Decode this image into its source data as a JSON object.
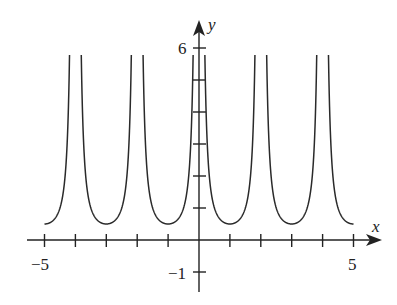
{
  "chart_data": {
    "type": "line",
    "title": "",
    "xlabel": "x",
    "ylabel": "y",
    "function": "y = 1/(2 sin^2(pi x / 2)) = 1/(1 - cos(pi x))",
    "xlim": [
      -5,
      5
    ],
    "ylim": [
      -1,
      6
    ],
    "grid": false,
    "legend": null,
    "x_tick_values": [
      -5,
      -4,
      -3,
      -2,
      -1,
      1,
      2,
      3,
      4,
      5
    ],
    "x_tick_labels": [
      {
        "value": -5,
        "label": "−5"
      },
      {
        "value": 5,
        "label": "5"
      }
    ],
    "y_tick_values": [
      -1,
      1,
      2,
      3,
      4,
      5,
      6
    ],
    "y_tick_labels": [
      {
        "value": 6,
        "label": "6"
      },
      {
        "value": -1,
        "label": "−1"
      }
    ],
    "vertical_asymptotes": [
      -4,
      -2,
      0,
      2,
      4
    ],
    "period": 2,
    "local_minima": [
      {
        "x": -5,
        "y": 0.5
      },
      {
        "x": -3,
        "y": 0.5
      },
      {
        "x": -1,
        "y": 0.5
      },
      {
        "x": 1,
        "y": 0.5
      },
      {
        "x": 3,
        "y": 0.5
      },
      {
        "x": 5,
        "y": 0.5
      }
    ],
    "clip_y_max": 6,
    "series": [
      {
        "name": "f(x)",
        "points": [
          [
            -5,
            0.5
          ],
          [
            -4.8,
            0.53
          ],
          [
            -4.6,
            0.62
          ],
          [
            -4.4,
            0.83
          ],
          [
            -4.3,
            1.06
          ],
          [
            -4.2,
            1.6
          ],
          [
            -4.19,
            6
          ],
          [
            -3.81,
            6
          ],
          [
            -3.8,
            1.6
          ],
          [
            -3.6,
            0.83
          ],
          [
            -3.4,
            0.62
          ],
          [
            -3.2,
            0.53
          ],
          [
            -3,
            0.5
          ],
          [
            -2.8,
            0.53
          ],
          [
            -2.6,
            0.62
          ],
          [
            -2.4,
            0.83
          ],
          [
            -2.2,
            1.6
          ],
          [
            -2.19,
            6
          ],
          [
            -1.81,
            6
          ],
          [
            -1.8,
            1.6
          ],
          [
            -1.6,
            0.83
          ],
          [
            -1.4,
            0.62
          ],
          [
            -1.2,
            0.53
          ],
          [
            -1,
            0.5
          ],
          [
            -0.8,
            0.53
          ],
          [
            -0.6,
            0.62
          ],
          [
            -0.4,
            0.83
          ],
          [
            -0.2,
            1.6
          ],
          [
            -0.19,
            6
          ],
          [
            0.19,
            6
          ],
          [
            0.2,
            1.6
          ],
          [
            0.4,
            0.83
          ],
          [
            0.6,
            0.62
          ],
          [
            0.8,
            0.53
          ],
          [
            1,
            0.5
          ],
          [
            1.2,
            0.53
          ],
          [
            1.4,
            0.62
          ],
          [
            1.6,
            0.83
          ],
          [
            1.8,
            1.6
          ],
          [
            1.81,
            6
          ],
          [
            2.19,
            6
          ],
          [
            2.2,
            1.6
          ],
          [
            2.4,
            0.83
          ],
          [
            2.6,
            0.62
          ],
          [
            2.8,
            0.53
          ],
          [
            3,
            0.5
          ],
          [
            3.2,
            0.53
          ],
          [
            3.4,
            0.62
          ],
          [
            3.6,
            0.83
          ],
          [
            3.8,
            1.6
          ],
          [
            3.81,
            6
          ],
          [
            4.19,
            6
          ],
          [
            4.2,
            1.6
          ],
          [
            4.4,
            0.83
          ],
          [
            4.6,
            0.62
          ],
          [
            4.8,
            0.53
          ],
          [
            5,
            0.5
          ]
        ]
      }
    ]
  },
  "axes": {
    "x_axis_label": "x",
    "y_axis_label": "y",
    "label_neg5": "−5",
    "label_5": "5",
    "label_6": "6",
    "label_neg1": "−1"
  },
  "style": {
    "curve_color": "#2a2a2a",
    "axis_color": "#222222",
    "background": "#ffffff"
  }
}
